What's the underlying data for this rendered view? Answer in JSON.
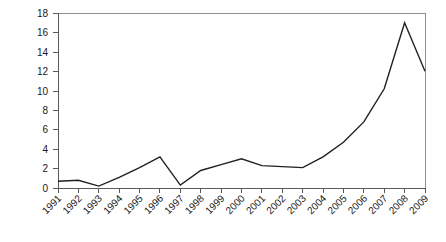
{
  "chart_data": {
    "type": "line",
    "title": "",
    "subtitle": "",
    "xlabel": "",
    "ylabel": "",
    "categories": [
      "1991",
      "1992",
      "1993",
      "1994",
      "1995",
      "1996",
      "1997",
      "1998",
      "1999",
      "2000",
      "2001",
      "2002",
      "2003",
      "2004",
      "2005",
      "2006",
      "2007",
      "2008",
      "2009"
    ],
    "values": [
      0.7,
      0.8,
      0.2,
      1.1,
      2.1,
      3.2,
      0.3,
      1.8,
      2.4,
      3.0,
      2.3,
      2.2,
      2.1,
      3.2,
      4.7,
      6.8,
      10.2,
      17.0,
      12.0
    ],
    "series": [
      {
        "name": "series-1",
        "values": [
          0.7,
          0.8,
          0.2,
          1.1,
          2.1,
          3.2,
          0.3,
          1.8,
          2.4,
          3.0,
          2.3,
          2.2,
          2.1,
          3.2,
          4.7,
          6.8,
          10.2,
          17.0,
          12.0
        ],
        "color": "#231f20"
      }
    ],
    "x_tick_labels": [
      "1991",
      "1992",
      "1993",
      "1994",
      "1995",
      "1996",
      "1997",
      "1998",
      "1999",
      "2000",
      "2001",
      "2002",
      "2003",
      "2004",
      "2005",
      "2006",
      "2007",
      "2008",
      "2009"
    ],
    "y_tick_labels": [
      "0",
      "2",
      "4",
      "6",
      "8",
      "10",
      "12",
      "14",
      "16",
      "18"
    ],
    "y_tick_values": [
      0,
      2,
      4,
      6,
      8,
      10,
      12,
      14,
      16,
      18
    ],
    "ylim": [
      0,
      18
    ],
    "xlim": [
      "1991",
      "2009"
    ],
    "grid": false,
    "legend": false,
    "legend_position": "none",
    "annotations": [],
    "x_label_rotation_deg": -45,
    "line_color": "#231f20",
    "axis_color": "#58595b",
    "frame_color": "#8e9092",
    "background_color": "#ffffff"
  }
}
